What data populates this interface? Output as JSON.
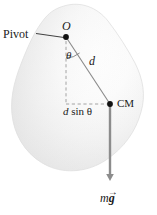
{
  "figure": {
    "kind": "physics-diagram",
    "labels": {
      "pivot": "Pivot",
      "pivot_point": "O",
      "angle": "θ",
      "distance": "d",
      "moment_arm_prefix": "d",
      "moment_arm_suffix": "sin θ",
      "center_of_mass": "CM",
      "force_mass": "m",
      "force_gravity": "g",
      "force_vector_arrow": "→"
    },
    "colors": {
      "body_fill_light": "#fdfdfd",
      "body_fill_mid": "#ececec",
      "body_fill_shadow": "#d6d6d6",
      "line": "#8a8a8a",
      "dashed_line": "#9a9a9a",
      "point_dot": "#111111",
      "force_arrow": "#8c8c8c",
      "leader_line": "#2b2b2b",
      "text": "#1a1a1a",
      "background": "#ffffff"
    },
    "geometry": {
      "pivot_point_xy": [
        66,
        37
      ],
      "center_of_mass_xy": [
        110,
        104
      ],
      "vertical_drop_foot_xy": [
        66,
        104
      ],
      "force_arrow_tip_xy": [
        110,
        184
      ],
      "leader_line_start_xy": [
        36,
        34
      ],
      "leader_line_end_xy": [
        64,
        38
      ]
    }
  }
}
